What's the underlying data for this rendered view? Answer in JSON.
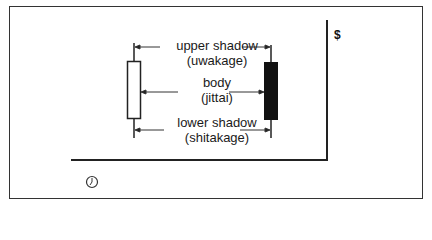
{
  "diagram": {
    "y_axis_label": "$",
    "x_axis_icon": "clock-icon",
    "labels": {
      "upper_shadow": {
        "line1": "upper shadow",
        "line2": "(uwakage)"
      },
      "body": {
        "line1": "body",
        "line2": "(jittai)"
      },
      "lower_shadow": {
        "line1": "lower shadow",
        "line2": "(shitakage)"
      }
    },
    "candles": [
      {
        "name": "white-candle",
        "fill": "#ffffff"
      },
      {
        "name": "black-candle",
        "fill": "#111111"
      }
    ]
  }
}
